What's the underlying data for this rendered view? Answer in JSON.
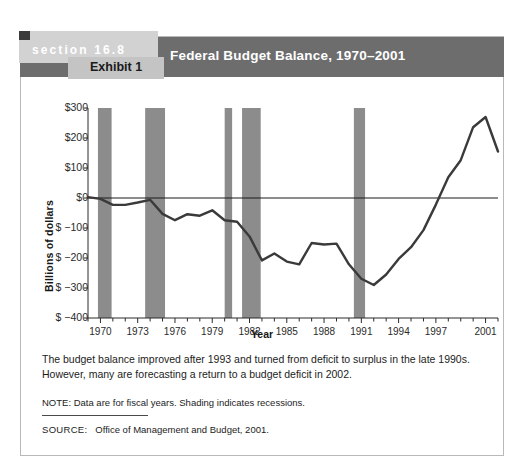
{
  "exhibit": {
    "section_label": "section 16.8",
    "exhibit_label": "Exhibit 1",
    "title": "Federal Budget Balance, 1970–2001"
  },
  "caption": {
    "line1": "The budget balance improved after 1993 and turned from deficit to surplus in the late 1990s.",
    "line2": "However, many are forecasting a return to a budget deficit in 2002.",
    "note": "NOTE: Data are for fiscal years. Shading indicates recessions.",
    "source_label": "SOURCE:",
    "source_text": "Office of Management and Budget, 2001."
  },
  "colors": {
    "header_bar": "#6d6d6d",
    "section_block": "#d2d2d2",
    "exhibit_block": "#c4c4c4",
    "recession_band": "#8c8c8c",
    "line": "#3a3a3a",
    "zero_line": "#1a1a1a"
  },
  "chart_data": {
    "type": "line",
    "title": "Federal Budget Balance, 1970–2001",
    "xlabel": "Year",
    "ylabel": "Billions of dollars",
    "xlim": [
      1969,
      2002
    ],
    "ylim": [
      -400,
      300
    ],
    "grid": false,
    "legend": "none",
    "ytick_labels": [
      "$300",
      "$200",
      "$100",
      "$0",
      "$ −100",
      "$ −200",
      "$ −300",
      "$ −400"
    ],
    "ytick_values": [
      300,
      200,
      100,
      0,
      -100,
      -200,
      -300,
      -400
    ],
    "xtick_labels": [
      "1970",
      "1973",
      "1976",
      "1979",
      "1982",
      "1985",
      "1988",
      "1991",
      "1994",
      "1997",
      "2001"
    ],
    "xtick_values": [
      1970,
      1973,
      1976,
      1979,
      1982,
      1985,
      1988,
      1991,
      1994,
      1997,
      2001
    ],
    "minor_xticks_every": 1,
    "zero_line": 0,
    "series": [
      {
        "name": "Federal budget balance",
        "x": [
          1969,
          1970,
          1971,
          1972,
          1973,
          1974,
          1975,
          1976,
          1977,
          1978,
          1979,
          1980,
          1981,
          1982,
          1983,
          1984,
          1985,
          1986,
          1987,
          1988,
          1989,
          1990,
          1991,
          1992,
          1993,
          1994,
          1995,
          1996,
          1997,
          1998,
          1999,
          2000,
          2001,
          2002
        ],
        "values": [
          3,
          -3,
          -23,
          -23,
          -15,
          -6,
          -53,
          -74,
          -54,
          -59,
          -41,
          -74,
          -79,
          -128,
          -208,
          -185,
          -212,
          -221,
          -150,
          -155,
          -152,
          -221,
          -269,
          -290,
          -255,
          -203,
          -164,
          -107,
          -22,
          69,
          126,
          236,
          270,
          155
        ]
      }
    ],
    "shaded_regions": [
      {
        "label": "recession",
        "start": 1969.8,
        "end": 1970.9
      },
      {
        "label": "recession",
        "start": 1973.6,
        "end": 1975.2
      },
      {
        "label": "recession",
        "start": 1980.0,
        "end": 1980.6
      },
      {
        "label": "recession",
        "start": 1981.4,
        "end": 1982.9
      },
      {
        "label": "recession",
        "start": 1990.4,
        "end": 1991.3
      }
    ],
    "annotations": []
  }
}
